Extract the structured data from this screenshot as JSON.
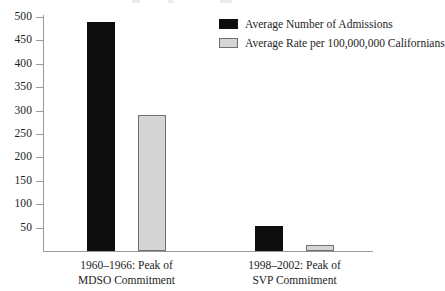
{
  "chart_data": {
    "type": "bar",
    "title": "",
    "xlabel": "",
    "ylabel": "",
    "ylim": [
      0,
      500
    ],
    "grid": false,
    "legend_position": "top-right",
    "categories": [
      "1960–1966: Peak of MDSO Commitment",
      "1998–2002: Peak of SVP Commitment"
    ],
    "category_lines": [
      [
        "1960–1966: Peak of",
        "MDSO Commitment"
      ],
      [
        "1998–2002: Peak of",
        "SVP Commitment"
      ]
    ],
    "series": [
      {
        "name": "Average Number of Admissions",
        "color": "#0d0d0d",
        "values": [
          490,
          53
        ]
      },
      {
        "name": "Average Rate per 100,000,000 Californians",
        "color": "#d5d5d5",
        "values": [
          290,
          13
        ]
      }
    ],
    "yticks": [
      50,
      100,
      150,
      200,
      250,
      300,
      350,
      400,
      450,
      500
    ],
    "ytick_labels": [
      "50",
      "100",
      "150",
      "200",
      "250",
      "300",
      "350",
      "400",
      "450",
      "500"
    ]
  },
  "legend": {
    "entries": [
      {
        "label": "Average Number of Admissions",
        "swatch": "dark-square-swatch"
      },
      {
        "label": "Average Rate per 100,000,000 Californians",
        "swatch": "light-square-swatch"
      }
    ]
  },
  "colors": {
    "series_dark": "#0d0d0d",
    "series_light": "#d5d5d5",
    "series_light_border": "#6f6f6f",
    "axis": "#9a9a9a",
    "text": "#1d1d1d",
    "background": "#ffffff"
  }
}
